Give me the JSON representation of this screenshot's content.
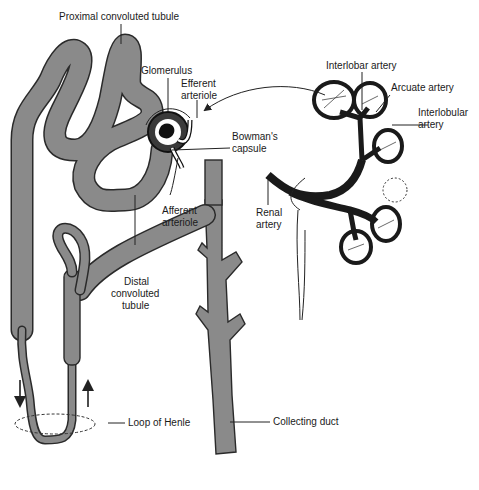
{
  "diagram": {
    "colors": {
      "tubule_fill": "#8a8a8a",
      "outline": "#2a2a2a",
      "artery": "#2a2a2a",
      "background": "#ffffff"
    },
    "labels": {
      "proximal_convoluted_tubule": "Proximal convoluted tubule",
      "glomerulus": "Glomerulus",
      "efferent_arteriole_1": "Efferent",
      "efferent_arteriole_2": "arteriole",
      "bowmans_capsule_1": "Bowman's",
      "bowmans_capsule_2": "capsule",
      "afferent_arteriole_1": "Afferent",
      "afferent_arteriole_2": "arteriole",
      "distal_convoluted_tubule_1": "Distal",
      "distal_convoluted_tubule_2": "convoluted",
      "distal_convoluted_tubule_3": "tubule",
      "loop_of_henle": "Loop of Henle",
      "collecting_duct": "Collecting duct",
      "interlobar_artery": "Interlobar artery",
      "arcuate_artery": "Arcuate artery",
      "interlobular_artery_1": "Interlobular",
      "interlobular_artery_2": "artery",
      "renal_artery_1": "Renal",
      "renal_artery_2": "artery"
    },
    "flow_arrows": [
      "down",
      "up"
    ]
  }
}
